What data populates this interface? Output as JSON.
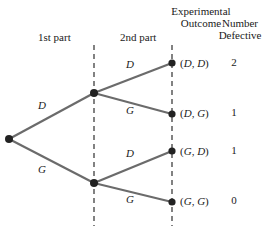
{
  "headers": {
    "first_part": "1st part",
    "second_part": "2nd part",
    "experimental": "Experimental",
    "outcome": "Outcome",
    "number": "Number",
    "defective": "Defective"
  },
  "branch_labels": {
    "level1_upper": "D",
    "level1_lower": "G",
    "level2_upper_upper": "D",
    "level2_upper_lower": "G",
    "level2_lower_upper": "D",
    "level2_lower_lower": "G"
  },
  "outcomes": [
    {
      "open": "(",
      "first": "D",
      "sep": ", ",
      "second": "D",
      "close": ")",
      "defective": "2"
    },
    {
      "open": "(",
      "first": "D",
      "sep": ", ",
      "second": "G",
      "close": ")",
      "defective": "1"
    },
    {
      "open": "(",
      "first": "G",
      "sep": ", ",
      "second": "D",
      "close": ")",
      "defective": "1"
    },
    {
      "open": "(",
      "first": "G",
      "sep": ", ",
      "second": "G",
      "close": ")",
      "defective": "0"
    }
  ],
  "colors": {
    "line": "#6b6b6b",
    "node": "#222222",
    "dashed": "#4d4d4d",
    "text": "#1a1a1a"
  }
}
